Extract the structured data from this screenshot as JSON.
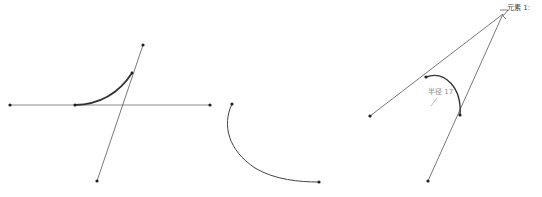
{
  "labels": {
    "element": "元素 1:",
    "radius": "半径 17"
  },
  "colors": {
    "line": "#555555",
    "arc": "#333333",
    "point": "#222222",
    "background": "#ffffff"
  },
  "figures": [
    {
      "name": "tangent-arc-fillet",
      "lines": [
        {
          "x1": 10,
          "y1": 105,
          "x2": 210,
          "y2": 105
        },
        {
          "x1": 143,
          "y1": 45,
          "x2": 97,
          "y2": 181
        }
      ],
      "points": [
        [
          10,
          105
        ],
        [
          210,
          105
        ],
        [
          75,
          105
        ],
        [
          143,
          45
        ],
        [
          97,
          181
        ],
        [
          132,
          73
        ]
      ],
      "arc": {
        "from": [
          75,
          105
        ],
        "to": [
          132,
          73
        ]
      }
    },
    {
      "name": "free-arc",
      "points": [
        [
          232,
          104
        ],
        [
          319,
          182
        ]
      ],
      "arc": {
        "from": [
          232,
          104
        ],
        "to": [
          319,
          182
        ]
      }
    },
    {
      "name": "corner-fillet-with-radius",
      "lines": [
        {
          "x1": 503,
          "y1": 14,
          "x2": 370,
          "y2": 116
        },
        {
          "x1": 503,
          "y1": 14,
          "x2": 428,
          "y2": 181
        }
      ],
      "points": [
        [
          370,
          116
        ],
        [
          428,
          181
        ],
        [
          426,
          77
        ],
        [
          460,
          115
        ]
      ],
      "arc": {
        "from": [
          426,
          77
        ],
        "to": [
          460,
          115
        ]
      },
      "radius": 17
    }
  ]
}
